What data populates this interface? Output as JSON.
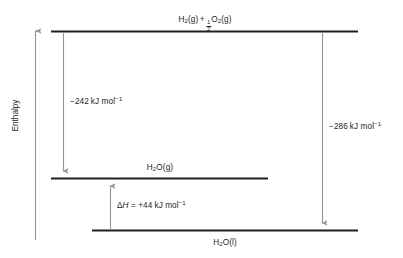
{
  "diagram": {
    "type": "enthalpy-level-diagram",
    "axis": {
      "label": "Enthalpy",
      "direction": "up",
      "ticks": []
    },
    "colors": {
      "line": "#231f20",
      "arrow": "#939598",
      "text": "#231f20",
      "background": "#ffffff"
    },
    "levels": [
      {
        "id": "reactants",
        "label_parts": {
          "species1": "H",
          "species1_sub": "2",
          "species1_state": "(g)",
          "plus": "+",
          "frac_num": "1",
          "frac_den": "2",
          "species2": "O",
          "species2_sub": "2",
          "species2_state": "(g)"
        },
        "label_text": "H2(g) + 1/2O2(g)",
        "position": "top"
      },
      {
        "id": "water-gas",
        "label_parts": {
          "species": "H",
          "sub": "2",
          "species_rest": "O",
          "state": "(g)"
        },
        "label_text": "H2O(g)",
        "position": "middle"
      },
      {
        "id": "water-liquid",
        "label_parts": {
          "species": "H",
          "sub": "2",
          "species_rest": "O",
          "state": "(l)"
        },
        "label_text": "H2O(l)",
        "position": "bottom"
      }
    ],
    "transitions": [
      {
        "id": "formation-gas",
        "from": "reactants",
        "to": "water-gas",
        "direction": "down",
        "value": "−242",
        "unit": "kJ mol",
        "unit_sup": "−1",
        "label_text": "−242 kJ mol⁻¹"
      },
      {
        "id": "formation-liquid",
        "from": "reactants",
        "to": "water-liquid",
        "direction": "down",
        "value": "−286",
        "unit": "kJ mol",
        "unit_sup": "−1",
        "label_text": "−286 kJ mol⁻¹"
      },
      {
        "id": "vaporisation",
        "from": "water-liquid",
        "to": "water-gas",
        "direction": "up",
        "prefix_delta": "Δ",
        "prefix_h": "H",
        "equals": " = ",
        "value": "+44",
        "unit": "kJ mol",
        "unit_sup": "−1",
        "label_text": "ΔH = +44 kJ mol⁻¹"
      }
    ]
  }
}
